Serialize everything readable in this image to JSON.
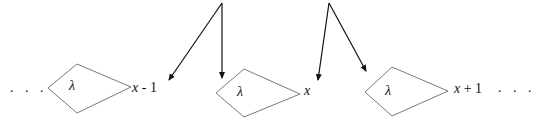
{
  "diagram": {
    "left_ellipsis": ". . .",
    "right_ellipsis": ". . .",
    "nodes": [
      {
        "symbol": "λ",
        "label_var": "x",
        "label_suffix": " - 1"
      },
      {
        "symbol": "λ",
        "label_var": "x",
        "label_suffix": ""
      },
      {
        "symbol": "λ",
        "label_var": "x",
        "label_suffix": " + 1"
      }
    ],
    "arrow_groups": [
      {
        "from": "top",
        "targets": [
          "node-0",
          "node-1"
        ]
      },
      {
        "from": "top",
        "targets": [
          "node-1",
          "node-2"
        ]
      }
    ],
    "colors": {
      "shape_stroke": "#7a7a7a",
      "arrow_stroke": "#111111",
      "text": "#111111",
      "background": "#ffffff"
    }
  }
}
